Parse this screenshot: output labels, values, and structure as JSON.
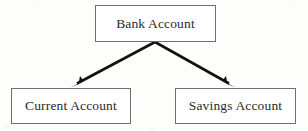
{
  "diagram": {
    "type": "inheritance-hierarchy",
    "background_color": "#fdfdfc",
    "box_border_color": "#6e6e6e",
    "box_fill_color": "#ffffff",
    "text_color": "#2a2a2a",
    "edge_color": "#111111",
    "nodes": [
      {
        "id": "root",
        "label": "Bank Account",
        "role": "superclass",
        "x": 95,
        "y": 5,
        "width": 121,
        "height": 37
      },
      {
        "id": "current",
        "label": "Current Account",
        "role": "subclass",
        "x": 11,
        "y": 88,
        "width": 120,
        "height": 36
      },
      {
        "id": "savings",
        "label": "Savings Account",
        "role": "subclass",
        "x": 175,
        "y": 88,
        "width": 121,
        "height": 36
      }
    ],
    "edges": [
      {
        "id": "edge-root-current",
        "from": "root",
        "to": "current",
        "arrowhead": "filled-triangle",
        "start_x": 155,
        "start_y": 42,
        "end_x": 72,
        "end_y": 87
      },
      {
        "id": "edge-root-savings",
        "from": "root",
        "to": "savings",
        "arrowhead": "filled-triangle",
        "start_x": 155,
        "start_y": 42,
        "end_x": 234,
        "end_y": 87
      }
    ]
  }
}
